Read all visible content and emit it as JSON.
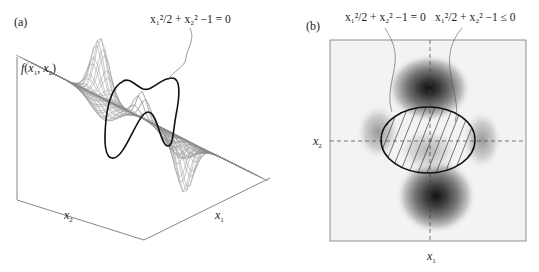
{
  "figure": {
    "panel_a": {
      "label": "(a)",
      "z_axis_label": {
        "fn": "f",
        "args": [
          "x",
          "1",
          "x",
          "2"
        ]
      },
      "x1_axis_label": {
        "var": "x",
        "sub": "1"
      },
      "x2_axis_label": {
        "var": "x",
        "sub": "2"
      },
      "constraint_annotation": "x₁²/2 + x₂² −1 = 0",
      "mesh_color": "#8a8a8a",
      "curve_color": "#111111",
      "box_color": "#666666"
    },
    "panel_b": {
      "label": "(b)",
      "x1_axis_label": {
        "var": "x",
        "sub": "1"
      },
      "x2_axis_label": {
        "var": "x",
        "sub": "2"
      },
      "boundary_annotation": "x₁²/2 + x₂² −1 = 0",
      "region_annotation": "x₁²/2 + x₂² −1 ≤ 0",
      "box_color": "#777777",
      "contour_dark": "#111111",
      "contour_light": "#f2f2f2"
    }
  }
}
